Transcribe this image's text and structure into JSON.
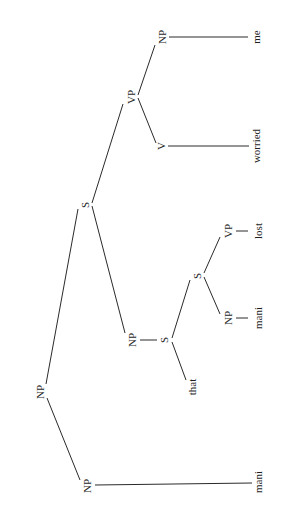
{
  "diagram": {
    "type": "syntax-tree",
    "orientation": "rotated-90-clockwise",
    "nodes": {
      "root_np": "NP",
      "head_np": "NP",
      "head_word": "mani",
      "rel_s": "S",
      "comp_np": "NP",
      "comp_s": "S",
      "comp_word": "that",
      "inner_s": "S",
      "inner_np": "NP",
      "inner_np_word": "mani",
      "inner_vp": "VP",
      "inner_vp_word": "lost",
      "vp": "VP",
      "v": "V",
      "v_word": "worried",
      "obj_np": "NP",
      "obj_word": "me"
    },
    "edges": [
      [
        "NP(root)",
        "NP(head)"
      ],
      [
        "NP(root)",
        "S"
      ],
      [
        "NP(head)",
        "mani"
      ],
      [
        "S",
        "NP(comp)"
      ],
      [
        "S",
        "VP"
      ],
      [
        "NP(comp)",
        "S(comp)"
      ],
      [
        "S(comp)",
        "that"
      ],
      [
        "S(comp)",
        "S(inner)"
      ],
      [
        "S(inner)",
        "NP(inner)"
      ],
      [
        "S(inner)",
        "VP(inner)"
      ],
      [
        "NP(inner)",
        "mani"
      ],
      [
        "VP(inner)",
        "lost"
      ],
      [
        "VP",
        "V"
      ],
      [
        "VP",
        "NP(obj)"
      ],
      [
        "V",
        "worried"
      ],
      [
        "NP(obj)",
        "me"
      ]
    ]
  }
}
